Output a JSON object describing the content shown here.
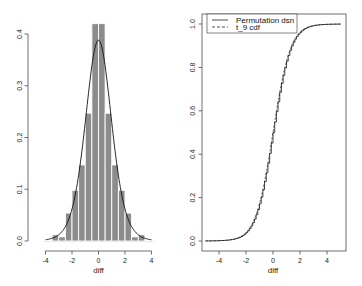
{
  "chart_data": [
    {
      "type": "bar",
      "subtype": "histogram_with_density",
      "title": "",
      "xlabel": "diff",
      "ylabel": "",
      "xlim": [
        -4.2,
        4.2
      ],
      "ylim": [
        0,
        0.42
      ],
      "x_ticks": [
        -4,
        -2,
        0,
        2,
        4
      ],
      "x_tick_labels": [
        "-4",
        "-2",
        "0",
        "2",
        "4"
      ],
      "y_ticks": [
        0.0,
        0.1,
        0.2,
        0.3,
        0.4
      ],
      "y_tick_labels": [
        "0.0",
        "0.1",
        "0.2",
        "0.3",
        "0.4"
      ],
      "grid": false,
      "bin_edges": [
        -3.5,
        -3.0,
        -2.5,
        -2.0,
        -1.5,
        -1.0,
        -0.5,
        0.0,
        0.5,
        1.0,
        1.5,
        2.0,
        2.5,
        3.0,
        3.5
      ],
      "values": [
        0.012,
        0.008,
        0.054,
        0.098,
        0.147,
        0.247,
        0.42,
        0.42,
        0.247,
        0.147,
        0.098,
        0.054,
        0.008,
        0.012
      ],
      "overlay": {
        "name": "t_9 density",
        "df": 9,
        "peak": 0.388
      },
      "bar_color": "#8c8c8c"
    },
    {
      "type": "line",
      "subtype": "step_cdf",
      "title": "",
      "xlabel": "diff",
      "ylabel": "",
      "xlim": [
        -5.2,
        5.2
      ],
      "ylim": [
        0,
        1.0
      ],
      "x_ticks": [
        -4,
        -2,
        0,
        2,
        4
      ],
      "x_tick_labels": [
        "-4",
        "-2",
        "0",
        "2",
        "4"
      ],
      "y_ticks": [
        0.0,
        0.2,
        0.4,
        0.6,
        0.8,
        1.0
      ],
      "y_tick_labels": [
        "0.0",
        "0.2",
        "0.4",
        "0.6",
        "0.8",
        "1.0"
      ],
      "grid": false,
      "legend_position": "top-left",
      "series": [
        {
          "name": "Permutation dsn",
          "style": "solid",
          "x_range": [
            -5,
            5
          ]
        },
        {
          "name": "t_9 cdf",
          "style": "dashed",
          "df": 9,
          "x_range": [
            -5,
            5
          ]
        }
      ]
    }
  ],
  "left_plot": {
    "xlabel": "diff",
    "x_ticks": [
      "-4",
      "-2",
      "0",
      "2",
      "4"
    ],
    "y_ticks": [
      "0.0",
      "0.1",
      "0.2",
      "0.3",
      "0.4"
    ]
  },
  "right_plot": {
    "xlabel": "diff",
    "x_ticks": [
      "-4",
      "-2",
      "0",
      "2",
      "4"
    ],
    "y_ticks": [
      "0.0",
      "0.2",
      "0.4",
      "0.6",
      "0.8",
      "1.0"
    ],
    "legend": {
      "items": [
        {
          "label": "Permutation dsn",
          "style": "solid"
        },
        {
          "label": "t_9 cdf",
          "style": "dashed"
        }
      ]
    }
  }
}
